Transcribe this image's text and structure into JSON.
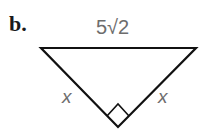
{
  "problem_label": "b.",
  "triangle": {
    "hypotenuse_label": "5√2",
    "left_leg_label": "x",
    "right_leg_label": "x",
    "right_angle_marker": true
  },
  "colors": {
    "lines": "#111111",
    "labels": "#6d6d6d",
    "problem_label": "#1a1a1a"
  }
}
